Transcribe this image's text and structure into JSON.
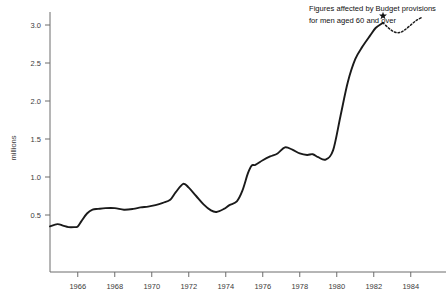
{
  "chart_data": {
    "type": "line",
    "title": "",
    "xlabel": "",
    "ylabel": "millions",
    "xlim": [
      1964.5,
      1984.6
    ],
    "ylim": [
      0.0,
      3.2
    ],
    "grid": false,
    "legend": null,
    "xticks": [
      "1966",
      "1968",
      "1970",
      "1972",
      "1974",
      "1976",
      "1978",
      "1980",
      "1982",
      "1984"
    ],
    "xtick_values": [
      1966,
      1968,
      1970,
      1972,
      1974,
      1976,
      1978,
      1980,
      1982,
      1984
    ],
    "yticks": [
      "0.5",
      "1.0",
      "1.5",
      "2.0",
      "2.5",
      "3.0"
    ],
    "ytick_values": [
      0.5,
      1.0,
      1.5,
      2.0,
      2.5,
      3.0
    ],
    "series": [
      {
        "name": "Claimants (solid)",
        "style": "solid",
        "x": [
          1964.5,
          1964.9,
          1965.2,
          1965.5,
          1965.8,
          1966.0,
          1966.2,
          1966.5,
          1966.8,
          1967.1,
          1967.5,
          1968.0,
          1968.5,
          1969.0,
          1969.4,
          1969.8,
          1970.2,
          1970.6,
          1971.0,
          1971.3,
          1971.7,
          1972.0,
          1972.4,
          1972.8,
          1973.2,
          1973.5,
          1973.9,
          1974.2,
          1974.6,
          1974.9,
          1975.2,
          1975.4,
          1975.6,
          1976.0,
          1976.4,
          1976.8,
          1977.2,
          1977.6,
          1978.0,
          1978.4,
          1978.7,
          1979.0,
          1979.4,
          1979.8,
          1980.2,
          1980.6,
          1981.0,
          1981.4,
          1981.8,
          1982.1,
          1982.5
        ],
        "y": [
          0.35,
          0.38,
          0.36,
          0.34,
          0.34,
          0.35,
          0.42,
          0.52,
          0.57,
          0.58,
          0.59,
          0.59,
          0.57,
          0.58,
          0.6,
          0.61,
          0.63,
          0.66,
          0.7,
          0.8,
          0.91,
          0.86,
          0.75,
          0.64,
          0.56,
          0.54,
          0.58,
          0.63,
          0.68,
          0.82,
          1.05,
          1.15,
          1.16,
          1.22,
          1.27,
          1.31,
          1.39,
          1.36,
          1.31,
          1.29,
          1.3,
          1.26,
          1.23,
          1.35,
          1.8,
          2.25,
          2.55,
          2.72,
          2.86,
          2.96,
          3.03
        ]
      },
      {
        "name": "Projected (dotted)",
        "style": "dotted",
        "x": [
          1982.5,
          1982.8,
          1983.1,
          1983.4,
          1983.7,
          1984.0,
          1984.3,
          1984.6
        ],
        "y": [
          3.03,
          2.96,
          2.91,
          2.9,
          2.94,
          3.0,
          3.06,
          3.1
        ]
      }
    ],
    "markers": [
      {
        "name": "budget-provision-marker",
        "symbol": "star",
        "x": 1982.5,
        "y": 3.12
      }
    ],
    "annotations": [
      {
        "name": "budget-provisions-note",
        "line1": "Figures affected by Budget provisions",
        "line2": "for men aged 60 and over",
        "x": 1981.0,
        "y": 3.25
      }
    ],
    "colors": {
      "line": "#1a1a1a",
      "axis": "#6d6d6d",
      "text": "#3b3b3b",
      "background": "#ffffff"
    }
  }
}
